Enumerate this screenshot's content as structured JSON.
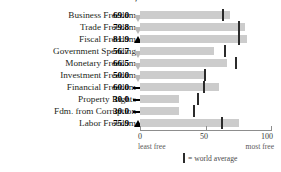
{
  "chart_data": {
    "type": "bar",
    "title": "INDIVIDUAL FREEDOMS, PERCENT",
    "xlabel": "",
    "ylabel": "",
    "xlim": [
      0,
      100
    ],
    "grid": false,
    "legend_position": "bottom",
    "categories": [
      "Business Freedom",
      "Trade Freedom",
      "Fiscal Freedom",
      "Government Spending",
      "Monetary Freedom",
      "Investment Freedom",
      "Financial Freedom",
      "Property Rights",
      "Fdm. from Corruption",
      "Labor Freedom"
    ],
    "values": [
      69.0,
      79.8,
      81.9,
      56.7,
      66.5,
      50.0,
      60.0,
      30.0,
      30.0,
      75.9
    ],
    "value_labels": [
      "69.0",
      "79.8",
      "81.9",
      "56.7",
      "66.5",
      "50.0",
      "60.0",
      "30.0",
      "30.0",
      "75.9"
    ],
    "change_indicators": [
      "down",
      "down",
      "up",
      "down",
      "down",
      "down",
      "flat",
      "flat",
      "flat",
      "up"
    ],
    "world_average": [
      62.3,
      74.5,
      75.0,
      63.9,
      72.8,
      48.5,
      48.0,
      43.6,
      40.2,
      61.5
    ],
    "ticks": [
      0,
      50,
      100
    ],
    "tick_labels": [
      "0",
      "50",
      "100"
    ],
    "axis_end_labels": {
      "left": "least free",
      "right": "most free"
    },
    "legend": {
      "marker": "vertical-bar",
      "text": "= world average"
    }
  }
}
